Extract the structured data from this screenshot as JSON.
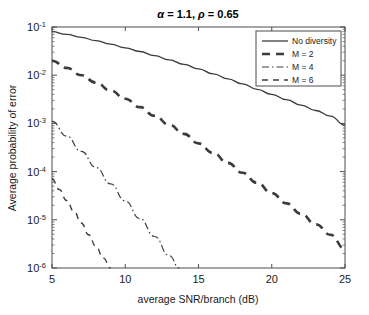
{
  "chart_data": {
    "type": "line",
    "title": "α = 1.1, ρ = 0.65",
    "title_parts": {
      "alpha_symbol": "α",
      "alpha_value": " = 1.1, ",
      "rho_symbol": "ρ",
      "rho_value": " = 0.65"
    },
    "xlabel": "average SNR/branch (dB)",
    "ylabel": "Average probability of error",
    "xscale": "linear",
    "yscale": "log",
    "xlim": [
      5,
      25
    ],
    "ylim": [
      1e-06,
      0.1
    ],
    "grid": false,
    "legend_position": "upper right",
    "xticks": [
      5,
      10,
      15,
      20,
      25
    ],
    "xticklabels": [
      "5",
      "10",
      "15",
      "20",
      "25"
    ],
    "yticks": [
      0.1,
      0.01,
      0.001,
      0.0001,
      1e-05,
      1e-06
    ],
    "yticklabels": [
      "10-1",
      "10-2",
      "10-3",
      "10-4",
      "10-5",
      "10-6"
    ],
    "ytick_mantissa": "10",
    "ytick_exponents": [
      "-1",
      "-2",
      "-3",
      "-4",
      "-5",
      "-6"
    ],
    "series": [
      {
        "name": "No diversity",
        "style": "solid",
        "x": [
          5,
          6,
          7,
          8,
          9,
          10,
          11,
          12,
          13,
          14,
          15,
          16,
          17,
          18,
          19,
          20,
          21,
          22,
          23,
          24,
          25
        ],
        "y": [
          0.08,
          0.07,
          0.061,
          0.052,
          0.044,
          0.037,
          0.031,
          0.0255,
          0.0208,
          0.0168,
          0.0135,
          0.0107,
          0.0084,
          0.0066,
          0.0051,
          0.004,
          0.0031,
          0.0024,
          0.00185,
          0.00142,
          0.00092
        ]
      },
      {
        "name": "M = 2",
        "style": "dashed",
        "x": [
          5,
          6,
          7,
          8,
          9,
          10,
          11,
          12,
          13,
          14,
          15,
          16,
          17,
          18,
          19,
          20,
          21,
          22,
          23,
          24,
          25
        ],
        "y": [
          0.02,
          0.0142,
          0.01,
          0.007,
          0.0048,
          0.00325,
          0.00218,
          0.00144,
          0.00094,
          0.000605,
          0.000385,
          0.000243,
          0.000152,
          9.45e-05,
          5.83e-05,
          3.58e-05,
          2.19e-05,
          1.33e-05,
          8.1e-06,
          4.9e-06,
          2.5e-06
        ]
      },
      {
        "name": "M = 4",
        "style": "dashdot",
        "x": [
          5,
          6,
          7,
          8,
          9,
          10,
          11,
          12,
          13,
          13.7
        ],
        "y": [
          0.0011,
          0.000545,
          0.000262,
          0.000122,
          5.55e-05,
          2.46e-05,
          1.06e-05,
          4.5e-06,
          1.8e-06,
          1e-06
        ]
      },
      {
        "name": "M = 6",
        "style": "dashed-thin",
        "x": [
          5,
          5.5,
          6,
          6.5,
          7,
          7.5,
          8,
          8.5,
          9
        ],
        "y": [
          7e-05,
          4.25e-05,
          2.52e-05,
          1.48e-05,
          8.6e-06,
          4.9e-06,
          2.8e-06,
          1.6e-06,
          1e-06
        ]
      }
    ]
  },
  "legend": {
    "items": [
      {
        "label": "No diversity"
      },
      {
        "label": "M = 2"
      },
      {
        "label": "M = 4"
      },
      {
        "label": "M = 6"
      }
    ]
  }
}
